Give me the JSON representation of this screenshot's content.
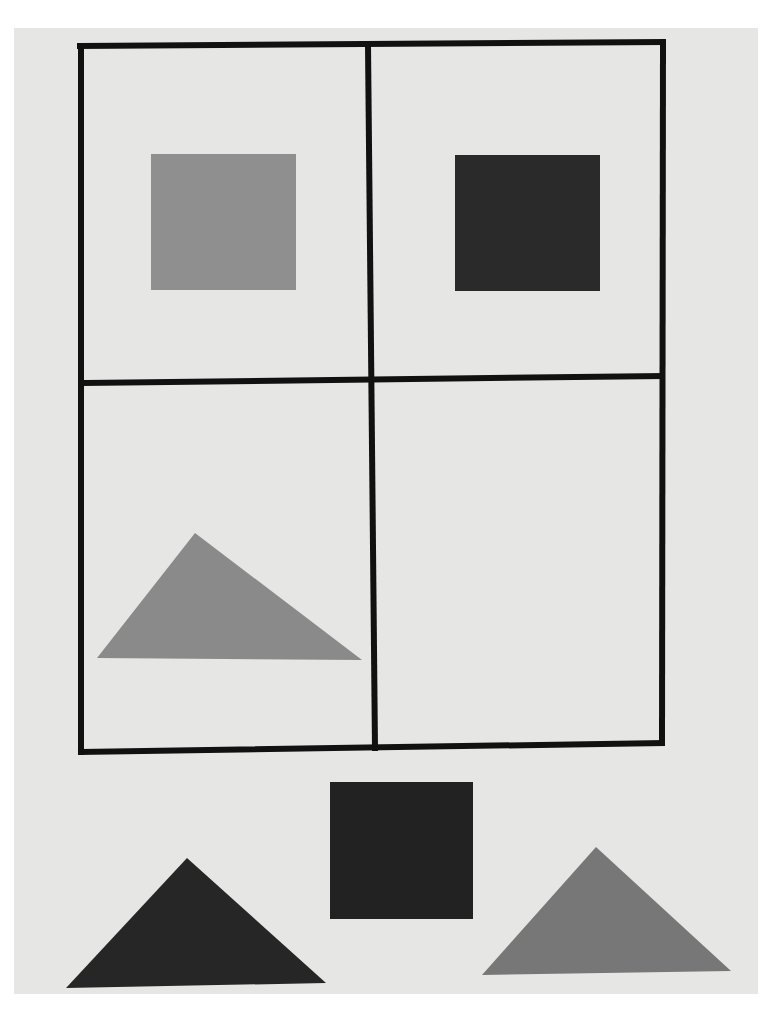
{
  "figure": {
    "colors": {
      "paper": "#e6e6e4",
      "grid_line": "#111111",
      "light_gray": "#8f8f8f",
      "dark_gray": "#2a2a2a",
      "medium_gray": "#7c7c7c"
    },
    "matrix": [
      {
        "cell": "top-left",
        "shape": "square",
        "shade": "light-gray"
      },
      {
        "cell": "top-right",
        "shape": "square",
        "shade": "dark-gray"
      },
      {
        "cell": "bottom-left",
        "shape": "triangle",
        "shade": "light-gray"
      },
      {
        "cell": "bottom-right",
        "shape": "empty",
        "shade": "none"
      }
    ],
    "choices": [
      {
        "position": "left",
        "shape": "triangle",
        "shade": "dark-gray"
      },
      {
        "position": "center",
        "shape": "square",
        "shade": "dark-gray"
      },
      {
        "position": "right",
        "shape": "triangle",
        "shade": "medium-gray"
      }
    ]
  }
}
